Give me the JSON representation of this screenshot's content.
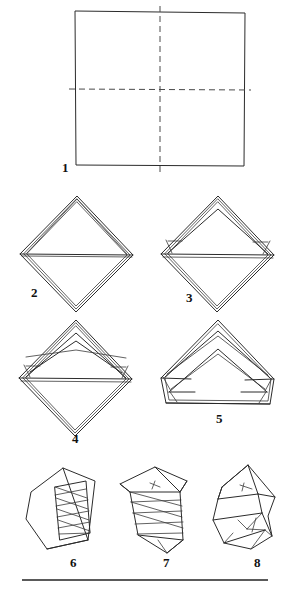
{
  "page": {
    "kind": "origami-instruction-diagram",
    "background_color": "#ffffff",
    "ink_color": "#2b2b2b",
    "width": 289,
    "height": 592
  },
  "steps": [
    {
      "number": "1",
      "label_x": 62,
      "label_y": 161,
      "caption": "square sheet with horizontal and vertical dashed crease lines"
    },
    {
      "number": "2",
      "label_x": 31,
      "label_y": 286,
      "caption": "diamond with horizontal fold line and layered edges"
    },
    {
      "number": "3",
      "label_x": 186,
      "label_y": 291,
      "caption": "diamond with inner triangular peak and folded side flaps"
    },
    {
      "number": "4",
      "label_x": 72,
      "label_y": 432,
      "caption": "diamond with two nested triangular peaks"
    },
    {
      "number": "5",
      "label_x": 216,
      "label_y": 412,
      "caption": "fan of nested chevrons with flat bottom edge"
    },
    {
      "number": "6",
      "label_x": 70,
      "label_y": 556,
      "caption": "tilted body with pleated band of diagonal creases"
    },
    {
      "number": "7",
      "label_x": 163,
      "label_y": 556,
      "caption": "twisted pleated form seen three quarters on"
    },
    {
      "number": "8",
      "label_x": 254,
      "label_y": 556,
      "caption": "finished faceted model"
    }
  ],
  "footer": {
    "rule_y": 580,
    "rule_x1": 22,
    "rule_x2": 268
  }
}
